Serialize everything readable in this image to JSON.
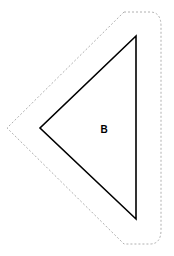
{
  "diagram": {
    "shape_label": "B",
    "shape_type": "triangle",
    "stroke_color": "#000000",
    "outline_color": "#b0b0b0",
    "triangle_points": "136,36 40,128 136,219",
    "outline_path": "M 124 12 L 150 12 Q 161 12 161 26 L 161 230 Q 161 244 150 244 L 124 244 L 7 128 Z"
  }
}
